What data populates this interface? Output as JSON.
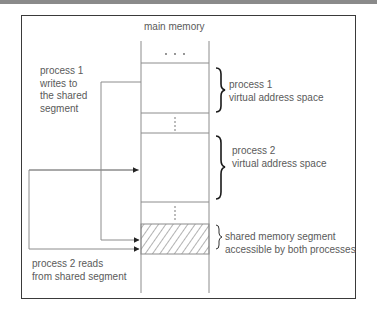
{
  "diagram": {
    "title": "main memory",
    "memory_regions": [
      {
        "id": "top",
        "label": ". . .",
        "kind": "ellipsis"
      },
      {
        "id": "process-1",
        "label": "",
        "kind": "block"
      },
      {
        "id": "gap-1",
        "label": "⋮",
        "kind": "ellipsis"
      },
      {
        "id": "process-2",
        "label": "",
        "kind": "block"
      },
      {
        "id": "gap-2",
        "label": "⋮",
        "kind": "ellipsis"
      },
      {
        "id": "shared",
        "label": "",
        "kind": "hatched"
      },
      {
        "id": "bottom",
        "label": "",
        "kind": "block"
      }
    ],
    "right_labels": {
      "process1": {
        "line1": "process 1",
        "line2": "virtual address space"
      },
      "process2": {
        "line1": "process 2",
        "line2": "virtual address space"
      },
      "shared": {
        "line1": "shared memory segment",
        "line2": "accessible by both processes"
      }
    },
    "left_labels": {
      "process1_writes": {
        "line1": "process 1",
        "line2": "writes to",
        "line3": "the shared",
        "line4": "segment"
      },
      "process2_reads": {
        "line1": "process 2 reads",
        "line2": "from shared segment"
      }
    },
    "colors": {
      "line": "#8c8c8c",
      "frame": "#3a3a3a",
      "brace": "#1a1a1a",
      "text": "#5a5a5a",
      "arrow": "#222222"
    }
  }
}
